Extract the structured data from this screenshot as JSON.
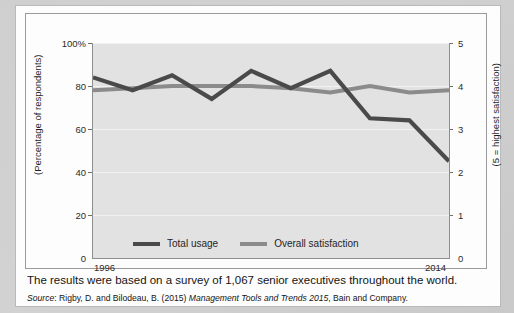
{
  "caption": "The results were based on a survey of 1,067 senior executives throughout the world.",
  "source": {
    "label": "Source",
    "separator": ": ",
    "authors": "Rigby, D. and Bilodeau, B. (2015) ",
    "title": "Management Tools and Trends 2015",
    "publisher": ", Bain and Company."
  },
  "colors": {
    "total_usage": "#4a4a4a",
    "overall_satisfaction": "#8b8b8b",
    "plot_background": "#e2e2e2",
    "gridline": "#f2f2f2",
    "axis": "#8d8d8d",
    "page": "#fdfdfd",
    "desktop": "#cfcfcf"
  },
  "chart_data": {
    "type": "line",
    "title": "",
    "xlabel": "",
    "ylabel": "(Percentage of respondents)",
    "ylabel_right": "(5 = highest satisfaction)",
    "grid": true,
    "legend_position": "bottom-inside",
    "x_axis": {
      "start_label": "1996",
      "end_label": "2014",
      "ticks": [
        "1996",
        "2014"
      ]
    },
    "y_axis_left": {
      "ticks": [
        0,
        20,
        40,
        60,
        80,
        100
      ],
      "tick_labels": [
        "0",
        "20",
        "40",
        "60",
        "80",
        "100%"
      ],
      "ylim": [
        0,
        100
      ],
      "unit": "%"
    },
    "y_axis_right": {
      "ticks": [
        0,
        1,
        2,
        3,
        4,
        5
      ],
      "tick_labels": [
        "0",
        "1",
        "2",
        "3",
        "4",
        "5"
      ],
      "ylim": [
        0,
        5
      ]
    },
    "x": [
      1996,
      1998,
      2000,
      2002,
      2004,
      2006,
      2008,
      2010,
      2012,
      2014
    ],
    "series": [
      {
        "name": "Total usage",
        "color": "#4a4a4a",
        "axis": "left",
        "unit": "%",
        "values": [
          84,
          78,
          85,
          74,
          87,
          79,
          87,
          65,
          64,
          45
        ]
      },
      {
        "name": "Overall satisfaction",
        "color": "#8b8b8b",
        "axis": "right",
        "unit": "rating",
        "values": [
          3.9,
          3.95,
          4.0,
          4.0,
          4.0,
          3.95,
          3.85,
          4.0,
          3.85,
          3.9
        ]
      }
    ],
    "legend": [
      {
        "label": "Total usage",
        "color": "#4a4a4a"
      },
      {
        "label": "Overall satisfaction",
        "color": "#8b8b8b"
      }
    ]
  }
}
